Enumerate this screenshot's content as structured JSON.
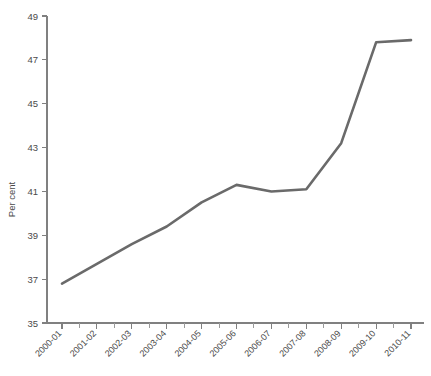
{
  "chart_data": {
    "type": "line",
    "title": "",
    "subtitle": "",
    "xlabel": "",
    "ylabel": "Per cent",
    "categories": [
      "2000-01",
      "2001-02",
      "2002-03",
      "2003-04",
      "2004-05",
      "2005-06",
      "2006-07",
      "2007-08",
      "2008-09",
      "2009-10",
      "2010-11"
    ],
    "values": [
      36.8,
      37.7,
      38.6,
      39.4,
      40.5,
      41.3,
      41.0,
      41.1,
      43.2,
      47.8,
      47.9
    ],
    "series": [
      {
        "name": "Per cent",
        "values": [
          36.8,
          37.7,
          38.6,
          39.4,
          40.5,
          41.3,
          41.0,
          41.1,
          43.2,
          47.8,
          47.9
        ]
      }
    ],
    "ylim": [
      35,
      49
    ],
    "ytick_values": [
      35,
      37,
      39,
      41,
      43,
      45,
      47,
      49
    ],
    "ytick_labels": [
      "35",
      "37",
      "39",
      "41",
      "43",
      "45",
      "47",
      "49"
    ],
    "grid": false,
    "legend": false,
    "legend_position": "none",
    "line_color": "#6a6a6a",
    "axis_color": "#808080",
    "background_color": "#ffffff"
  },
  "axes": {
    "y_title": "Per cent"
  }
}
